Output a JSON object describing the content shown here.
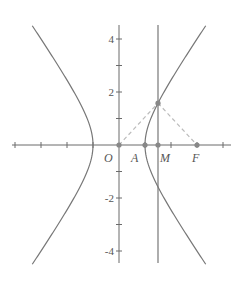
{
  "diagram": {
    "type": "hyperbola-construction",
    "equation": "x^2 - y^2/2 = 1",
    "colors": {
      "axis": "#6b6b6b",
      "curve": "#777777",
      "dashed": "#bbbbbb",
      "point": "#888888",
      "text": "#555555"
    },
    "axes": {
      "x_ticks": [
        -4,
        -3,
        -2,
        -1,
        1,
        2,
        3,
        4
      ],
      "y_ticks": [
        -4,
        -3,
        -2,
        -1,
        1,
        2,
        3,
        4
      ],
      "y_tick_labels": [
        {
          "value": 4,
          "text": "4"
        },
        {
          "value": 2,
          "text": "2"
        },
        {
          "value": -2,
          "text": "-2"
        },
        {
          "value": -4,
          "text": "-4"
        }
      ]
    },
    "points": {
      "O": {
        "label": "O",
        "x": 0,
        "y": 0
      },
      "A": {
        "label": "A",
        "x": 1,
        "y": 0
      },
      "M": {
        "label": "M",
        "x": 1.5,
        "y": 0
      },
      "F": {
        "label": "F",
        "x": 3,
        "y": 0
      },
      "P": {
        "label": "",
        "x": 1.5,
        "y": 1.58
      }
    },
    "vertical_line": {
      "x": 1.5
    },
    "dashed_segments": [
      [
        "O",
        "P"
      ],
      [
        "P",
        "F"
      ]
    ]
  }
}
